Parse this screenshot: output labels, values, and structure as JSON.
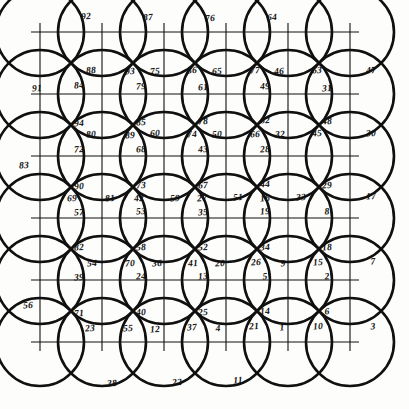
{
  "figure": {
    "ink_color": "#101010",
    "paper_color": "#fdfdfb",
    "grid": {
      "columns": 6,
      "rows": 6,
      "x_lines": [
        40,
        102,
        164,
        226,
        288,
        350
      ],
      "y_lines": [
        32,
        94,
        156,
        218,
        280,
        342
      ],
      "circle_radius": 44,
      "line_width_thick": 2.6,
      "line_width_thin": 1.1
    },
    "labels": [
      {
        "t": "92",
        "x": 86,
        "y": 17
      },
      {
        "t": "87",
        "x": 148,
        "y": 18
      },
      {
        "t": "76",
        "x": 210,
        "y": 19
      },
      {
        "t": "64",
        "x": 272,
        "y": 18
      },
      {
        "t": "91",
        "x": 37,
        "y": 89
      },
      {
        "t": "88",
        "x": 91,
        "y": 71
      },
      {
        "t": "93",
        "x": 130,
        "y": 72
      },
      {
        "t": "75",
        "x": 155,
        "y": 72
      },
      {
        "t": "86",
        "x": 192,
        "y": 71
      },
      {
        "t": "65",
        "x": 217,
        "y": 72
      },
      {
        "t": "77",
        "x": 255,
        "y": 71
      },
      {
        "t": "46",
        "x": 279,
        "y": 72
      },
      {
        "t": "63",
        "x": 317,
        "y": 71
      },
      {
        "t": "47",
        "x": 371,
        "y": 71
      },
      {
        "t": "84",
        "x": 79,
        "y": 86
      },
      {
        "t": "79",
        "x": 141,
        "y": 87
      },
      {
        "t": "61",
        "x": 203,
        "y": 88
      },
      {
        "t": "49",
        "x": 265,
        "y": 87
      },
      {
        "t": "31",
        "x": 327,
        "y": 89
      },
      {
        "t": "94",
        "x": 79,
        "y": 124
      },
      {
        "t": "85",
        "x": 141,
        "y": 123
      },
      {
        "t": "78",
        "x": 203,
        "y": 122
      },
      {
        "t": "62",
        "x": 265,
        "y": 121
      },
      {
        "t": "48",
        "x": 327,
        "y": 122
      },
      {
        "t": "80",
        "x": 91,
        "y": 135
      },
      {
        "t": "89",
        "x": 130,
        "y": 136
      },
      {
        "t": "60",
        "x": 155,
        "y": 134
      },
      {
        "t": "74",
        "x": 192,
        "y": 135
      },
      {
        "t": "50",
        "x": 217,
        "y": 135
      },
      {
        "t": "66",
        "x": 255,
        "y": 135
      },
      {
        "t": "32",
        "x": 280,
        "y": 135
      },
      {
        "t": "45",
        "x": 317,
        "y": 134
      },
      {
        "t": "30",
        "x": 371,
        "y": 134
      },
      {
        "t": "72",
        "x": 79,
        "y": 150
      },
      {
        "t": "68",
        "x": 141,
        "y": 150
      },
      {
        "t": "43",
        "x": 203,
        "y": 150
      },
      {
        "t": "28",
        "x": 265,
        "y": 150
      },
      {
        "t": "83",
        "x": 24,
        "y": 166
      },
      {
        "t": "90",
        "x": 79,
        "y": 187
      },
      {
        "t": "73",
        "x": 141,
        "y": 186
      },
      {
        "t": "67",
        "x": 203,
        "y": 186
      },
      {
        "t": "44",
        "x": 265,
        "y": 185
      },
      {
        "t": "29",
        "x": 327,
        "y": 186
      },
      {
        "t": "69",
        "x": 72,
        "y": 199
      },
      {
        "t": "81",
        "x": 110,
        "y": 199
      },
      {
        "t": "42",
        "x": 139,
        "y": 199
      },
      {
        "t": "59",
        "x": 175,
        "y": 199
      },
      {
        "t": "27",
        "x": 202,
        "y": 199
      },
      {
        "t": "51",
        "x": 238,
        "y": 198
      },
      {
        "t": "16",
        "x": 265,
        "y": 199
      },
      {
        "t": "33",
        "x": 301,
        "y": 198
      },
      {
        "t": "17",
        "x": 371,
        "y": 197
      },
      {
        "t": "57",
        "x": 79,
        "y": 213
      },
      {
        "t": "53",
        "x": 141,
        "y": 212
      },
      {
        "t": "35",
        "x": 203,
        "y": 213
      },
      {
        "t": "19",
        "x": 265,
        "y": 212
      },
      {
        "t": "8",
        "x": 327,
        "y": 212
      },
      {
        "t": "82",
        "x": 79,
        "y": 248
      },
      {
        "t": "58",
        "x": 141,
        "y": 248
      },
      {
        "t": "52",
        "x": 203,
        "y": 248
      },
      {
        "t": "34",
        "x": 265,
        "y": 248
      },
      {
        "t": "18",
        "x": 327,
        "y": 248
      },
      {
        "t": "54",
        "x": 92,
        "y": 264
      },
      {
        "t": "70",
        "x": 130,
        "y": 264
      },
      {
        "t": "36",
        "x": 157,
        "y": 264
      },
      {
        "t": "41",
        "x": 193,
        "y": 264
      },
      {
        "t": "20",
        "x": 220,
        "y": 264
      },
      {
        "t": "26",
        "x": 256,
        "y": 263
      },
      {
        "t": "9",
        "x": 283,
        "y": 264
      },
      {
        "t": "15",
        "x": 318,
        "y": 263
      },
      {
        "t": "7",
        "x": 373,
        "y": 262
      },
      {
        "t": "39",
        "x": 79,
        "y": 278
      },
      {
        "t": "24",
        "x": 141,
        "y": 277
      },
      {
        "t": "13",
        "x": 203,
        "y": 277
      },
      {
        "t": "5",
        "x": 265,
        "y": 277
      },
      {
        "t": "2",
        "x": 327,
        "y": 277
      },
      {
        "t": "56",
        "x": 28,
        "y": 306
      },
      {
        "t": "71",
        "x": 79,
        "y": 314
      },
      {
        "t": "40",
        "x": 141,
        "y": 313
      },
      {
        "t": "25",
        "x": 203,
        "y": 313
      },
      {
        "t": "14",
        "x": 265,
        "y": 312
      },
      {
        "t": "6",
        "x": 327,
        "y": 312
      },
      {
        "t": "23",
        "x": 90,
        "y": 329
      },
      {
        "t": "55",
        "x": 128,
        "y": 329
      },
      {
        "t": "12",
        "x": 155,
        "y": 330
      },
      {
        "t": "37",
        "x": 192,
        "y": 328
      },
      {
        "t": "4",
        "x": 218,
        "y": 329
      },
      {
        "t": "21",
        "x": 254,
        "y": 327
      },
      {
        "t": "1",
        "x": 282,
        "y": 328
      },
      {
        "t": "10",
        "x": 318,
        "y": 327
      },
      {
        "t": "3",
        "x": 373,
        "y": 327
      },
      {
        "t": "38",
        "x": 112,
        "y": 384
      },
      {
        "t": "22",
        "x": 177,
        "y": 383
      },
      {
        "t": "11",
        "x": 238,
        "y": 381
      }
    ]
  }
}
